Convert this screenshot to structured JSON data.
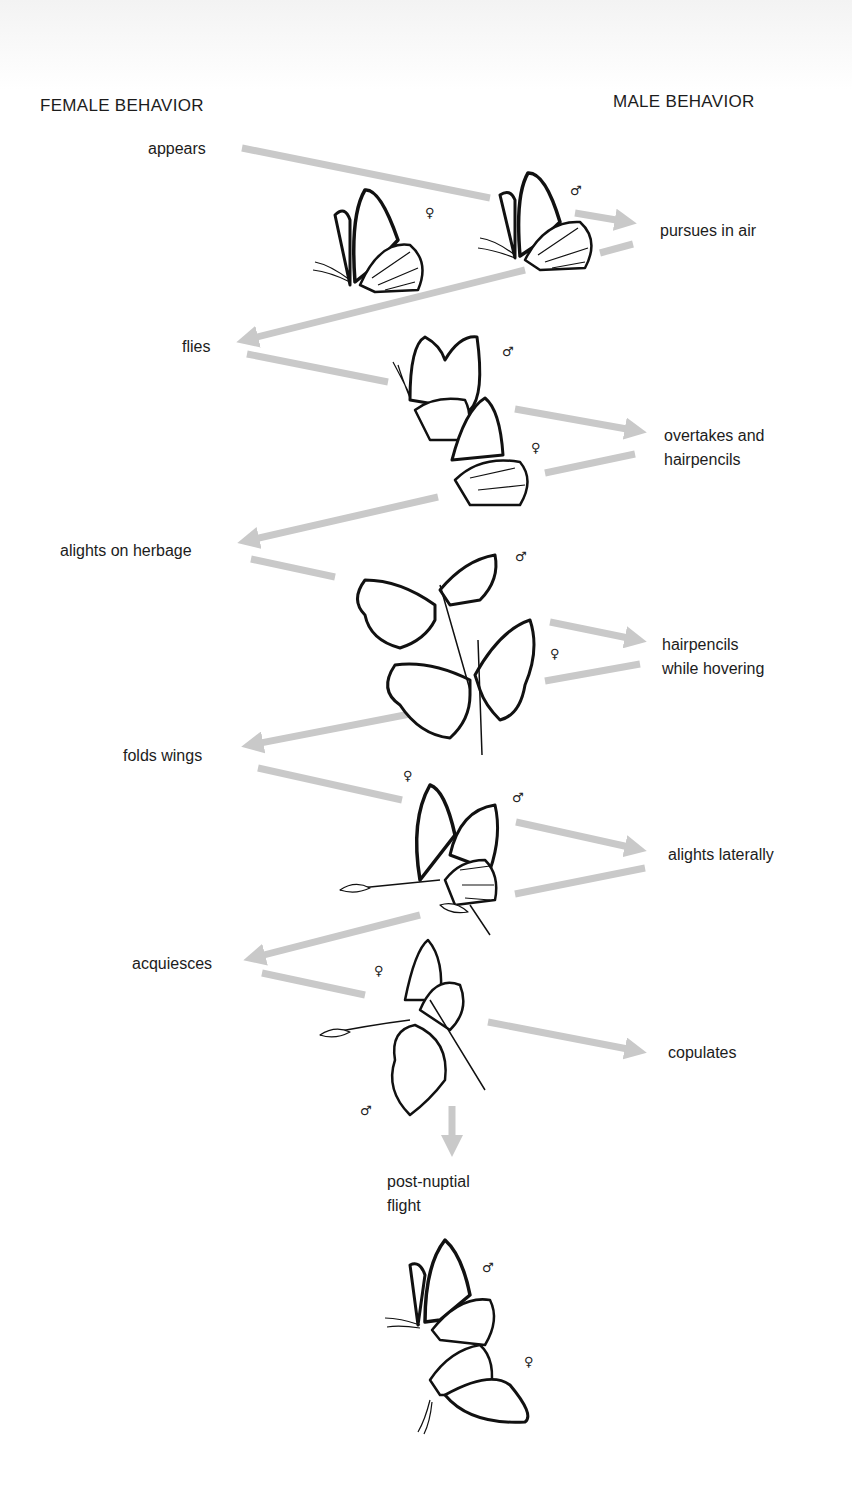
{
  "header": {
    "female_column": "FEMALE BEHAVIOR",
    "male_column": "MALE BEHAVIOR"
  },
  "steps": {
    "female": [
      {
        "label": "appears"
      },
      {
        "label": "flies"
      },
      {
        "label": "alights on herbage"
      },
      {
        "label": "folds wings"
      },
      {
        "label": "acquiesces"
      }
    ],
    "male": [
      {
        "label": "pursues in air"
      },
      {
        "label": "overtakes and",
        "label2": "hairpencils"
      },
      {
        "label": "hairpencils",
        "label2": "while hovering"
      },
      {
        "label": "alights laterally"
      },
      {
        "label": "copulates"
      }
    ],
    "final": {
      "label": "post-nuptial",
      "label2": "flight"
    }
  },
  "symbols": {
    "male": "♂",
    "female": "♀"
  },
  "colors": {
    "arrow": "#c9c9c9",
    "ink": "#111111"
  }
}
